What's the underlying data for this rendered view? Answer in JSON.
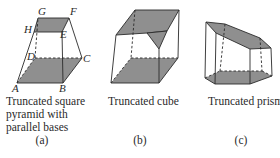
{
  "figures": [
    {
      "id": "a",
      "caption_lines": [
        "Truncated square",
        "pyramid with",
        "parallel bases"
      ],
      "sublabel": "(a)",
      "vertex_labels": {
        "G": "G",
        "F": "F",
        "H": "H",
        "E": "E",
        "D": "D",
        "C": "C",
        "A": "A",
        "B": "B"
      }
    },
    {
      "id": "b",
      "caption_lines": [
        "Truncated cube"
      ],
      "sublabel": "(b)"
    },
    {
      "id": "c",
      "caption_lines": [
        "Truncated prism"
      ],
      "sublabel": "(c)"
    }
  ],
  "colors": {
    "face_fill": "#8f8f8f",
    "edge": "#2a2a2a",
    "background": "#ffffff"
  }
}
